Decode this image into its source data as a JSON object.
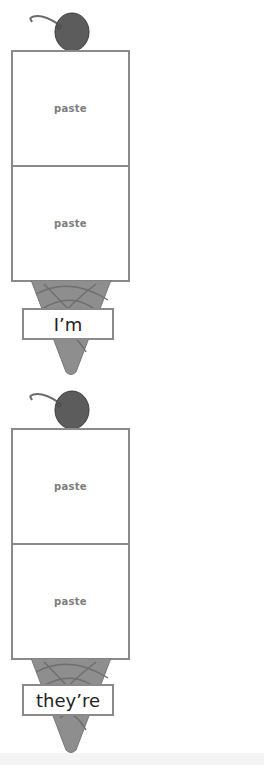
{
  "worksheet": {
    "sundaes": [
      {
        "scoops": [
          {
            "label": "paste"
          },
          {
            "label": "paste"
          }
        ],
        "cone_label": "I’m"
      },
      {
        "scoops": [
          {
            "label": "paste"
          },
          {
            "label": "paste"
          }
        ],
        "cone_label": "they’re"
      }
    ]
  },
  "colors": {
    "border": "#8a8a8a",
    "cone": "#8c8c8c",
    "cherry": "#5a5a5a",
    "paste_text": "#7d7d7d"
  }
}
